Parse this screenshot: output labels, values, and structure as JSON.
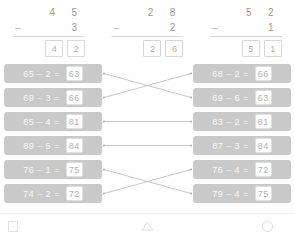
{
  "app": {
    "title": "Subtraction Practice Worksheet",
    "colors": {
      "pill_bg": "#c9c9c9",
      "pill_bg_alt": "#bdbdbd",
      "pill_text": "#ffffff",
      "box_bg": "#ffffff",
      "box_border": "#e0e0e0",
      "box_text": "#b3b3b3",
      "digit_text": "#9a9a9a",
      "rule": "#d8d8d8",
      "connector": "#b8b8b8",
      "page_bg": "#ffffff"
    }
  },
  "vertical_problems": [
    {
      "name": "vertical-problem-1",
      "minuend_tens": "4",
      "minuend_ones": "5",
      "operator": "–",
      "subtrahend_tens": "",
      "subtrahend_ones": "3",
      "answer_tens": "4",
      "answer_ones": "2"
    },
    {
      "name": "vertical-problem-2",
      "minuend_tens": "2",
      "minuend_ones": "8",
      "operator": "–",
      "subtrahend_tens": "",
      "subtrahend_ones": "2",
      "answer_tens": "2",
      "answer_ones": "6"
    },
    {
      "name": "vertical-problem-3",
      "minuend_tens": "5",
      "minuend_ones": "2",
      "operator": "–",
      "subtrahend_tens": "",
      "subtrahend_ones": "1",
      "answer_tens": "5",
      "answer_ones": "1"
    }
  ],
  "matching": {
    "left_column": [
      {
        "minuend": "65",
        "operator": "–",
        "subtrahend": "2",
        "equals": "=",
        "answer": "63"
      },
      {
        "minuend": "69",
        "operator": "–",
        "subtrahend": "3",
        "equals": "=",
        "answer": "66"
      },
      {
        "minuend": "85",
        "operator": "–",
        "subtrahend": "4",
        "equals": "=",
        "answer": "81"
      },
      {
        "minuend": "89",
        "operator": "–",
        "subtrahend": "5",
        "equals": "=",
        "answer": "84"
      },
      {
        "minuend": "76",
        "operator": "–",
        "subtrahend": "1",
        "equals": "=",
        "answer": "75"
      },
      {
        "minuend": "74",
        "operator": "–",
        "subtrahend": "2",
        "equals": "=",
        "answer": "72"
      }
    ],
    "right_column": [
      {
        "minuend": "68",
        "operator": "–",
        "subtrahend": "2",
        "equals": "=",
        "answer": "66"
      },
      {
        "minuend": "69",
        "operator": "–",
        "subtrahend": "6",
        "equals": "=",
        "answer": "63"
      },
      {
        "minuend": "83",
        "operator": "–",
        "subtrahend": "2",
        "equals": "=",
        "answer": "81"
      },
      {
        "minuend": "87",
        "operator": "–",
        "subtrahend": "3",
        "equals": "=",
        "answer": "84"
      },
      {
        "minuend": "76",
        "operator": "–",
        "subtrahend": "4",
        "equals": "=",
        "answer": "72"
      },
      {
        "minuend": "79",
        "operator": "–",
        "subtrahend": "4",
        "equals": "=",
        "answer": "75"
      }
    ],
    "connections": [
      {
        "from": 0,
        "to": 1
      },
      {
        "from": 1,
        "to": 0
      },
      {
        "from": 2,
        "to": 2
      },
      {
        "from": 3,
        "to": 3
      },
      {
        "from": 4,
        "to": 5
      },
      {
        "from": 5,
        "to": 4
      }
    ]
  },
  "navbar": {
    "recents_label": "recents",
    "back_label": "back",
    "home_label": "home"
  }
}
